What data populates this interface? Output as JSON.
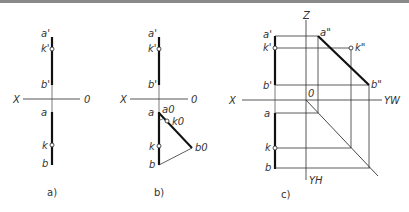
{
  "figure": {
    "panels": [
      {
        "caption": "a)",
        "axis": {
          "left": "X",
          "right": "0"
        },
        "labels": {
          "a_prime": "a'",
          "k_prime": "k'",
          "b_prime": "b'",
          "a": "a",
          "k": "k",
          "b": "b"
        }
      },
      {
        "caption": "b)",
        "axis": {
          "left": "X",
          "right": "0"
        },
        "labels": {
          "a_prime": "a'",
          "k_prime": "k'",
          "b_prime": "b'",
          "a": "a",
          "k": "k",
          "b": "b",
          "a0": "a0",
          "k0": "k0",
          "b0": "b0"
        }
      },
      {
        "caption": "c)",
        "axis": {
          "left": "X",
          "origin": "0",
          "z": "Z",
          "yw": "YW",
          "yh": "YH"
        },
        "labels": {
          "a_prime": "a'",
          "k_prime": "k'",
          "b_prime": "b'",
          "a": "a",
          "k": "k",
          "b": "b",
          "a_dprime": "a\"",
          "k_dprime": "k\"",
          "b_dprime": "b\""
        }
      }
    ]
  }
}
